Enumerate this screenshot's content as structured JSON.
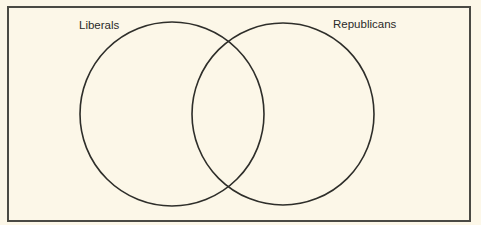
{
  "diagram": {
    "type": "venn",
    "sets": [
      {
        "label": "Liberals",
        "cx": 172,
        "cy": 114,
        "r": 92
      },
      {
        "label": "Republicans",
        "cx": 283,
        "cy": 114,
        "r": 91
      }
    ],
    "colors": {
      "background": "#fcf7e8",
      "stroke": "#2e2e2a",
      "frame": "#4a4a44"
    }
  }
}
